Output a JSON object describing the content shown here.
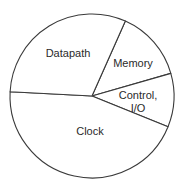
{
  "chart_data": {
    "type": "pie",
    "title": "",
    "categories": [
      "Datapath",
      "Memory",
      "Control, I/O",
      "Clock"
    ],
    "values": [
      31,
      14,
      10,
      45
    ],
    "unit": "percent (estimated from slice angles; no numeric labels shown)",
    "legend": "none (labels inside slices)",
    "start_angle_deg": 24,
    "direction": "clockwise",
    "slices": [
      {
        "label": "Memory",
        "lines": [
          "Memory"
        ],
        "value": 14,
        "start": 24,
        "end": 74
      },
      {
        "label": "Control, I/O",
        "lines": [
          "Control,",
          "I/O"
        ],
        "value": 10,
        "start": 74,
        "end": 112
      },
      {
        "label": "Clock",
        "lines": [
          "Clock"
        ],
        "value": 45,
        "start": 112,
        "end": 273
      },
      {
        "label": "Datapath",
        "lines": [
          "Datapath"
        ],
        "value": 31,
        "start": 273,
        "end": 384
      }
    ]
  },
  "labels": {
    "datapath": "Datapath",
    "memory": "Memory",
    "control_line1": "Control,",
    "control_line2": "I/O",
    "clock": "Clock"
  },
  "colors": {
    "fill": "#ffffff",
    "stroke": "#3a3a3a",
    "text": "#2a2a2a"
  }
}
